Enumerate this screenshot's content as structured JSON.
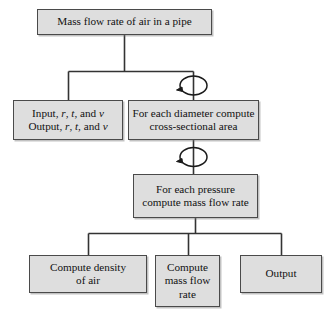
{
  "diagram": {
    "type": "structure-chart",
    "colors": {
      "box_fill": "#dedede",
      "box_border": "#4a4a4a",
      "connector": "#333333",
      "background": "#ffffff",
      "text": "#111111"
    },
    "nodes": {
      "root": {
        "id": "root",
        "label": "Mass flow rate of air in a pipe",
        "level": 0
      },
      "io": {
        "id": "io",
        "line1_prefix": "Input, ",
        "line1_v1": "r",
        "line1_sep1": ", ",
        "line1_v2": "t",
        "line1_sep2": ", and ",
        "line1_v3": "v",
        "line2_prefix": "Output, ",
        "line2_v1": "r",
        "line2_sep1": ", ",
        "line2_v2": "t",
        "line2_sep2": ", and ",
        "line2_v3": "v",
        "label_plain": "Input, r, t, and v Output, r, t, and v",
        "level": 1
      },
      "diameter": {
        "id": "diameter",
        "label": "For each diameter compute\ncross-sectional area",
        "level": 1,
        "loop": true
      },
      "pressure": {
        "id": "pressure",
        "label": "For each pressure\ncompute mass flow rate",
        "level": 2,
        "loop": true
      },
      "density": {
        "id": "density",
        "label": "Compute density\nof air",
        "level": 3
      },
      "massflow": {
        "id": "massflow",
        "label": "Compute\nmass flow\nrate",
        "level": 3
      },
      "output": {
        "id": "output",
        "label": "Output",
        "level": 3
      }
    },
    "loop_markers": [
      {
        "name": "loop-arrow-diameter",
        "attached_to": "diameter",
        "position": "above"
      },
      {
        "name": "loop-arrow-pressure",
        "attached_to": "pressure",
        "position": "above"
      }
    ],
    "edges": [
      {
        "from": "root",
        "to": "io"
      },
      {
        "from": "root",
        "to": "diameter"
      },
      {
        "from": "diameter",
        "to": "pressure"
      },
      {
        "from": "pressure",
        "to": "density"
      },
      {
        "from": "pressure",
        "to": "massflow"
      },
      {
        "from": "pressure",
        "to": "output"
      }
    ]
  }
}
